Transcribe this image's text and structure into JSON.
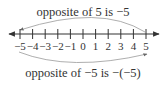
{
  "diagram": {
    "type": "number-line",
    "top_caption": "opposite of 5 is −5",
    "bottom_caption": "opposite of −5 is −(−5)",
    "ticks": [
      "−5",
      "−4",
      "−3",
      "−2",
      "−1",
      "0",
      "1",
      "2",
      "3",
      "4",
      "5"
    ],
    "tick_values": [
      -5,
      -4,
      -3,
      -2,
      -1,
      0,
      1,
      2,
      3,
      4,
      5
    ],
    "arrows": [
      {
        "from": 5,
        "to": -5,
        "side": "top"
      },
      {
        "from": -5,
        "to": 5,
        "side": "bottom"
      }
    ],
    "colors": {
      "ink": "#333333",
      "arc": "#888888"
    }
  }
}
